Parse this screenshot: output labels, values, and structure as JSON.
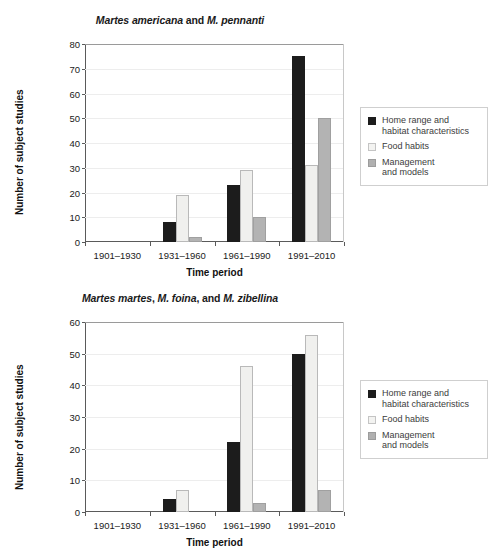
{
  "figure": {
    "ylabel": "Number of subject studies",
    "xlabel": "Time period",
    "categories": [
      "1901–1930",
      "1931–1960",
      "1961–1990",
      "1991–2010"
    ],
    "legend": {
      "items": [
        {
          "label": "Home range and\nhabitat characteristics",
          "swatch": "black-square-icon",
          "color": "#1c1c1c"
        },
        {
          "label": "Food habits",
          "swatch": "light-square-icon",
          "color": "#f3f3f1"
        },
        {
          "label": "Management\nand models",
          "swatch": "gray-square-icon",
          "color": "#b0b0b0"
        }
      ]
    }
  },
  "chart_data": [
    {
      "type": "bar",
      "title": "Martes americana and M. pennanti",
      "title_parts": [
        {
          "text": "Martes americana",
          "style": "italic"
        },
        {
          "text": " and ",
          "style": "roman"
        },
        {
          "text": "M. pennanti",
          "style": "italic"
        }
      ],
      "xlabel": "Time period",
      "ylabel": "Number of subject studies",
      "categories": [
        "1901–1930",
        "1931–1960",
        "1961–1990",
        "1991–2010"
      ],
      "series": [
        {
          "name": "Home range and habitat characteristics",
          "values": [
            0,
            8,
            23,
            75
          ],
          "color": "#1c1c1c"
        },
        {
          "name": "Food habits",
          "values": [
            0,
            19,
            29,
            31
          ],
          "color": "#f0f0ee"
        },
        {
          "name": "Management and models",
          "values": [
            0,
            2,
            10,
            50
          ],
          "color": "#b3b3b3"
        }
      ],
      "ylim": [
        0,
        80
      ],
      "yticks": [
        0,
        10,
        20,
        30,
        40,
        50,
        60,
        70,
        80
      ],
      "ytick_labels": [
        "0",
        "10",
        "20",
        "30",
        "40",
        "50",
        "60",
        "70",
        "80"
      ],
      "grid": true,
      "legend_position": "right"
    },
    {
      "type": "bar",
      "title": "Martes martes, M. foina, and M. zibellina",
      "title_parts": [
        {
          "text": "Martes martes",
          "style": "italic"
        },
        {
          "text": ", ",
          "style": "roman"
        },
        {
          "text": "M. foina",
          "style": "italic"
        },
        {
          "text": ", and ",
          "style": "roman"
        },
        {
          "text": "M. zibellina",
          "style": "italic"
        }
      ],
      "xlabel": "Time period",
      "ylabel": "Number of subject studies",
      "categories": [
        "1901–1930",
        "1931–1960",
        "1961–1990",
        "1991–2010"
      ],
      "series": [
        {
          "name": "Home range and habitat characteristics",
          "values": [
            0,
            4,
            22,
            50
          ],
          "color": "#1c1c1c"
        },
        {
          "name": "Food habits",
          "values": [
            0,
            7,
            46,
            56
          ],
          "color": "#f0f0ee"
        },
        {
          "name": "Management and models",
          "values": [
            0,
            0,
            3,
            7
          ],
          "color": "#b3b3b3"
        }
      ],
      "ylim": [
        0,
        60
      ],
      "yticks": [
        0,
        10,
        20,
        30,
        40,
        50,
        60
      ],
      "ytick_labels": [
        "0",
        "10",
        "20",
        "30",
        "40",
        "50",
        "60"
      ],
      "grid": true,
      "legend_position": "right"
    }
  ]
}
